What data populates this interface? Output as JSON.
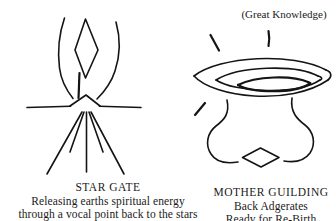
{
  "page": {
    "background_color": "#ffffff",
    "ink_color": "#141414",
    "width": 336,
    "height": 221
  },
  "annotations": {
    "great_knowledge": "(Great Knowledge)"
  },
  "figures": [
    {
      "id": "star-gate",
      "icon_name": "star-gate-glyph",
      "description": "Two curved arms rising from a central apex with a tall narrow diamond between them, a horizontal ground line through the apex, and five rays fanning downward"
    },
    {
      "id": "mother-guilding",
      "icon_name": "mother-guilding-glyph",
      "description": "Large lens or eye shape containing a smaller ellipse, two short tick strokes above, two curved bracket forms below and a small flat diamond at the bottom centre"
    }
  ],
  "captions": {
    "star_gate": {
      "title": "STAR GATE",
      "line_1": "Releasing earths spiritual energy",
      "line_2": "through a vocal point back to the stars"
    },
    "mother_guilding": {
      "title": "MOTHER GUILDING",
      "line_1": "Back Adgerates",
      "line_2": "Ready for Re-Birth"
    }
  }
}
